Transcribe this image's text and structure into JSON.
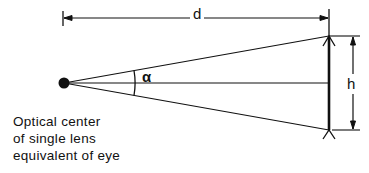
{
  "diagram": {
    "labels": {
      "distance": "d",
      "height": "h",
      "angle": "α"
    },
    "caption": {
      "lines": [
        "Optical center",
        "of single lens",
        "equivalent of eye"
      ]
    },
    "geometry": {
      "eye_point": [
        64,
        83
      ],
      "object_top": [
        329,
        36
      ],
      "object_bottom": [
        329,
        130
      ],
      "object_center": [
        329,
        83
      ],
      "distance_line_y": 18,
      "height_line_x": 353
    },
    "colors": {
      "line": "#111111",
      "background": "#ffffff"
    }
  }
}
